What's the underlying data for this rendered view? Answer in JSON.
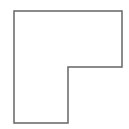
{
  "diagram": {
    "shape": "L-shape",
    "stroke_color": "#666666",
    "fill_color": "#ffffff",
    "stroke_width": 1.5,
    "points": "14,11 122,11 122,67 68,67 68,123 14,123"
  }
}
